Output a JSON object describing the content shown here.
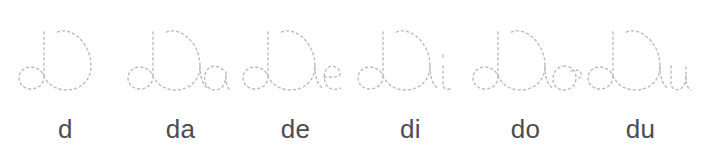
{
  "worksheet": {
    "title": "d syllable tracing worksheet",
    "background_color": "#ffffff",
    "trace_stroke_color": "#b9b9bd",
    "label_color": "#4c4c52",
    "stroke_style": "dotted-dashed",
    "columns": 6,
    "items": [
      {
        "id": "d",
        "label": "d",
        "trace_text": "d",
        "letters": [
          "d"
        ],
        "x": 8
      },
      {
        "id": "da",
        "label": "da",
        "trace_text": "da",
        "letters": [
          "d",
          "a"
        ],
        "x": 123
      },
      {
        "id": "de",
        "label": "de",
        "trace_text": "de",
        "letters": [
          "d",
          "e"
        ],
        "x": 238
      },
      {
        "id": "di",
        "label": "di",
        "trace_text": "di",
        "letters": [
          "d",
          "i"
        ],
        "x": 353
      },
      {
        "id": "do",
        "label": "do",
        "trace_text": "do",
        "letters": [
          "d",
          "o"
        ],
        "x": 468
      },
      {
        "id": "du",
        "label": "du",
        "trace_text": "du",
        "letters": [
          "d",
          "u"
        ],
        "x": 583
      }
    ]
  }
}
